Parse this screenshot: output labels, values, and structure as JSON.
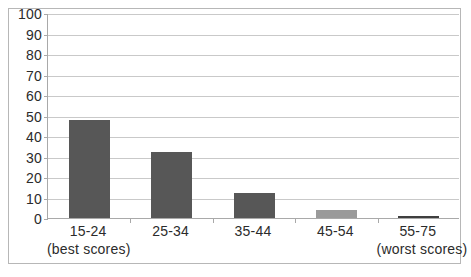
{
  "chart_data": {
    "type": "bar",
    "title": "",
    "subtitle": "",
    "xlabel": "",
    "ylabel": "",
    "grid": true,
    "legend": "none",
    "ylim": [
      0,
      100
    ],
    "ytick_step": 10,
    "ytick_labels": [
      "100",
      "90",
      "80",
      "70",
      "60",
      "50",
      "40",
      "30",
      "20",
      "10",
      "0"
    ],
    "ytick_values": [
      100,
      90,
      80,
      70,
      60,
      50,
      40,
      30,
      20,
      10,
      0
    ],
    "categories": [
      "15-24",
      "25-34",
      "35-44",
      "45-54",
      "55-75"
    ],
    "category_notes": [
      "(best scores)",
      "",
      "",
      "",
      "(worst scores)"
    ],
    "values": [
      48,
      32,
      12,
      4,
      1
    ],
    "bar_colors": [
      "#575757",
      "#575757",
      "#575757",
      "#9a9a9a",
      "#3f3f3f"
    ],
    "series": [
      {
        "name": "",
        "values": [
          48,
          32,
          12,
          4,
          1
        ]
      }
    ]
  },
  "style": {
    "plot_background": "#ffffff",
    "grid_color": "#c9c9c9",
    "axis_color": "#a9a9a9",
    "frame_color": "#b7b7b7",
    "text_color": "#2b2b2b"
  }
}
